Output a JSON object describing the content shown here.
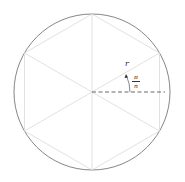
{
  "diagram": {
    "labels": {
      "radius": "r",
      "angle_num": "π",
      "angle_den": "n"
    },
    "colors": {
      "circle": "#666666",
      "hexagon": "#d9d9d9",
      "dashed": "#444444"
    }
  }
}
